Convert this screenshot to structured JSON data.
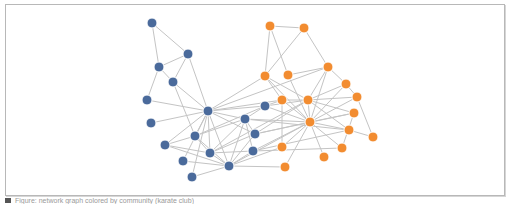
{
  "figure": {
    "caption": "Figure: network graph colored by community (karate club)",
    "colors": {
      "community_a": "#4a6a9b",
      "community_b": "#f28c30",
      "edge": "#c4c4c4",
      "frame": "#b8b8b8"
    }
  },
  "nodes": [
    {
      "id": "a1",
      "x": 152,
      "y": 23,
      "group": "a"
    },
    {
      "id": "a2",
      "x": 188,
      "y": 54,
      "group": "a"
    },
    {
      "id": "a3",
      "x": 159,
      "y": 67,
      "group": "a"
    },
    {
      "id": "a4",
      "x": 173,
      "y": 82,
      "group": "a"
    },
    {
      "id": "a5",
      "x": 147,
      "y": 100,
      "group": "a"
    },
    {
      "id": "a6",
      "x": 208,
      "y": 111,
      "group": "a"
    },
    {
      "id": "a7",
      "x": 151,
      "y": 123,
      "group": "a"
    },
    {
      "id": "a8",
      "x": 195,
      "y": 136,
      "group": "a"
    },
    {
      "id": "a9",
      "x": 165,
      "y": 145,
      "group": "a"
    },
    {
      "id": "a10",
      "x": 210,
      "y": 153,
      "group": "a"
    },
    {
      "id": "a11",
      "x": 183,
      "y": 161,
      "group": "a"
    },
    {
      "id": "a12",
      "x": 229,
      "y": 166,
      "group": "a"
    },
    {
      "id": "a13",
      "x": 192,
      "y": 177,
      "group": "a"
    },
    {
      "id": "a14",
      "x": 245,
      "y": 119,
      "group": "a"
    },
    {
      "id": "a15",
      "x": 255,
      "y": 134,
      "group": "a"
    },
    {
      "id": "a16",
      "x": 253,
      "y": 151,
      "group": "a"
    },
    {
      "id": "a17",
      "x": 265,
      "y": 106,
      "group": "a"
    },
    {
      "id": "b1",
      "x": 270,
      "y": 26,
      "group": "b"
    },
    {
      "id": "b2",
      "x": 304,
      "y": 28,
      "group": "b"
    },
    {
      "id": "b3",
      "x": 265,
      "y": 76,
      "group": "b"
    },
    {
      "id": "b4",
      "x": 288,
      "y": 75,
      "group": "b"
    },
    {
      "id": "b5",
      "x": 328,
      "y": 67,
      "group": "b"
    },
    {
      "id": "b6",
      "x": 346,
      "y": 84,
      "group": "b"
    },
    {
      "id": "b7",
      "x": 357,
      "y": 97,
      "group": "b"
    },
    {
      "id": "b8",
      "x": 282,
      "y": 100,
      "group": "b"
    },
    {
      "id": "b9",
      "x": 308,
      "y": 100,
      "group": "b"
    },
    {
      "id": "b10",
      "x": 310,
      "y": 122,
      "group": "b"
    },
    {
      "id": "b11",
      "x": 354,
      "y": 113,
      "group": "b"
    },
    {
      "id": "b12",
      "x": 349,
      "y": 130,
      "group": "b"
    },
    {
      "id": "b13",
      "x": 373,
      "y": 137,
      "group": "b"
    },
    {
      "id": "b14",
      "x": 282,
      "y": 147,
      "group": "b"
    },
    {
      "id": "b15",
      "x": 342,
      "y": 148,
      "group": "b"
    },
    {
      "id": "b16",
      "x": 324,
      "y": 157,
      "group": "b"
    },
    {
      "id": "b17",
      "x": 285,
      "y": 167,
      "group": "b"
    }
  ],
  "edges": [
    [
      "a1",
      "a2"
    ],
    [
      "a1",
      "a3"
    ],
    [
      "a2",
      "a3"
    ],
    [
      "a2",
      "a4"
    ],
    [
      "a3",
      "a4"
    ],
    [
      "a3",
      "a5"
    ],
    [
      "a2",
      "a6"
    ],
    [
      "a4",
      "a6"
    ],
    [
      "a4",
      "a8"
    ],
    [
      "a5",
      "a6"
    ],
    [
      "a7",
      "a6"
    ],
    [
      "a8",
      "a6"
    ],
    [
      "a9",
      "a6"
    ],
    [
      "a10",
      "a6"
    ],
    [
      "a11",
      "a6"
    ],
    [
      "a12",
      "a6"
    ],
    [
      "a13",
      "a6"
    ],
    [
      "a14",
      "a6"
    ],
    [
      "a15",
      "a6"
    ],
    [
      "a17",
      "a6"
    ],
    [
      "b3",
      "a6"
    ],
    [
      "b8",
      "a6"
    ],
    [
      "a8",
      "a9"
    ],
    [
      "a8",
      "a10"
    ],
    [
      "a8",
      "a12"
    ],
    [
      "a9",
      "a10"
    ],
    [
      "a9",
      "a12"
    ],
    [
      "a11",
      "a12"
    ],
    [
      "a13",
      "a12"
    ],
    [
      "a10",
      "a12"
    ],
    [
      "a14",
      "a12"
    ],
    [
      "a15",
      "a12"
    ],
    [
      "a16",
      "a12"
    ],
    [
      "a14",
      "a15"
    ],
    [
      "a14",
      "a16"
    ],
    [
      "a14",
      "a10"
    ],
    [
      "a15",
      "a10"
    ],
    [
      "a16",
      "a10"
    ],
    [
      "a17",
      "a14"
    ],
    [
      "a17",
      "a8"
    ],
    [
      "a14",
      "a8"
    ],
    [
      "b1",
      "b2"
    ],
    [
      "b1",
      "b3"
    ],
    [
      "b1",
      "b4"
    ],
    [
      "b2",
      "b3"
    ],
    [
      "b2",
      "b5"
    ],
    [
      "b3",
      "b8"
    ],
    [
      "b3",
      "b9"
    ],
    [
      "b3",
      "b10"
    ],
    [
      "b4",
      "b5"
    ],
    [
      "b4",
      "b10"
    ],
    [
      "b5",
      "b6"
    ],
    [
      "b5",
      "b9"
    ],
    [
      "b5",
      "b10"
    ],
    [
      "b6",
      "b7"
    ],
    [
      "b6",
      "b10"
    ],
    [
      "b7",
      "b13"
    ],
    [
      "b7",
      "b10"
    ],
    [
      "b7",
      "b9"
    ],
    [
      "b8",
      "b9"
    ],
    [
      "b8",
      "b10"
    ],
    [
      "b8",
      "b14"
    ],
    [
      "b9",
      "b10"
    ],
    [
      "b9",
      "b11"
    ],
    [
      "b9",
      "b12"
    ],
    [
      "b10",
      "b11"
    ],
    [
      "b10",
      "b12"
    ],
    [
      "b10",
      "b14"
    ],
    [
      "b10",
      "b15"
    ],
    [
      "b10",
      "b16"
    ],
    [
      "b10",
      "b17"
    ],
    [
      "b12",
      "b13"
    ],
    [
      "b11",
      "b15"
    ],
    [
      "b9",
      "b6"
    ],
    [
      "a17",
      "b9"
    ],
    [
      "a17",
      "b10"
    ],
    [
      "a17",
      "b8"
    ],
    [
      "a14",
      "b10"
    ],
    [
      "a15",
      "b10"
    ],
    [
      "a15",
      "b9"
    ],
    [
      "a16",
      "b10"
    ],
    [
      "a16",
      "b12"
    ],
    [
      "a12",
      "b10"
    ],
    [
      "a12",
      "b14"
    ],
    [
      "a12",
      "b17"
    ],
    [
      "a15",
      "b11"
    ],
    [
      "a16",
      "b15"
    ],
    [
      "a14",
      "b12"
    ],
    [
      "a6",
      "b5"
    ],
    [
      "a10",
      "b9"
    ]
  ]
}
